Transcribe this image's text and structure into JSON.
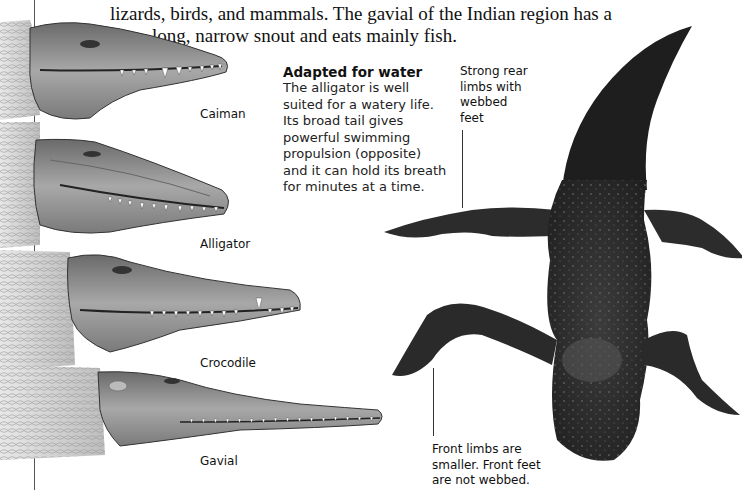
{
  "intro": {
    "line1": "lizards, birds, and mammals. The gavial of the Indian region has a",
    "line2": "long, narrow snout and eats mainly fish."
  },
  "sidebar": {
    "heading": "Adapted for water",
    "lines": [
      "The alligator is well",
      "suited for a watery life.",
      "Its broad tail gives",
      "powerful swimming",
      "propulsion (opposite)",
      "and it can hold its breath",
      "for minutes at a time."
    ]
  },
  "heads": [
    {
      "label": "Caiman"
    },
    {
      "label": "Alligator"
    },
    {
      "label": "Crocodile"
    },
    {
      "label": "Gavial"
    }
  ],
  "callouts": {
    "rear": [
      "Strong rear",
      "limbs with",
      "webbed",
      "feet"
    ],
    "front": [
      "Front limbs are",
      "smaller. Front feet",
      "are not webbed."
    ]
  },
  "colors": {
    "text": "#111111",
    "illustration_dark": "#2a2a2a",
    "illustration_mid": "#8a8a8a",
    "illustration_light": "#d8d8d8"
  }
}
